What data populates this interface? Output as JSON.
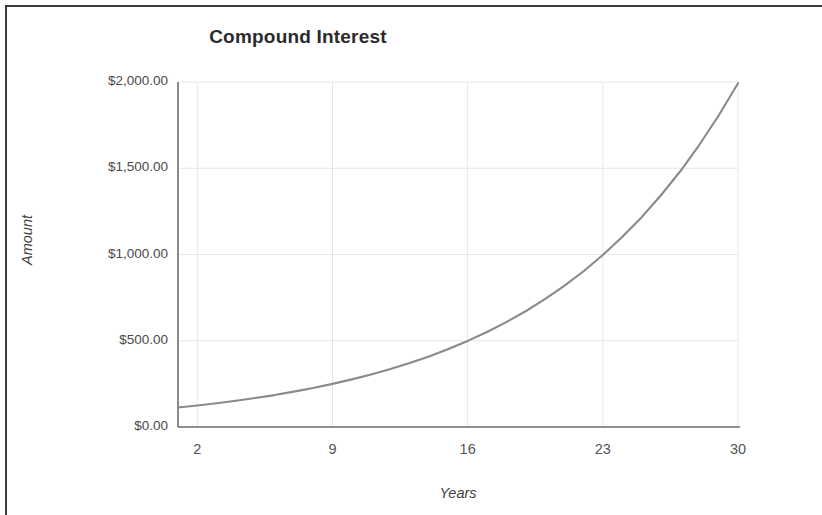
{
  "chart_data": {
    "type": "line",
    "title": "Compound Interest",
    "xlabel": "Years",
    "ylabel": "Amount",
    "xlim": [
      1,
      30
    ],
    "ylim": [
      0,
      2000
    ],
    "grid": true,
    "legend": false,
    "x_tick_labels": [
      "2",
      "9",
      "16",
      "23",
      "30"
    ],
    "x_tick_values": [
      2,
      9,
      16,
      23,
      30
    ],
    "y_tick_labels": [
      "$0.00",
      "$500.00",
      "$1,000.00",
      "$1,500.00",
      "$2,000.00"
    ],
    "y_tick_values": [
      0,
      500,
      1000,
      1500,
      2000
    ],
    "series": [
      {
        "name": "Amount",
        "color": "#8a8a8a",
        "x": [
          1,
          2,
          3,
          4,
          5,
          6,
          7,
          8,
          9,
          10,
          11,
          12,
          13,
          14,
          15,
          16,
          17,
          18,
          19,
          20,
          21,
          22,
          23,
          24,
          25,
          26,
          27,
          28,
          29,
          30
        ],
        "values": [
          113,
          125,
          138,
          152,
          168,
          185,
          205,
          226,
          250,
          276,
          304,
          336,
          371,
          409,
          452,
          499,
          551,
          608,
          671,
          741,
          818,
          903,
          997,
          1101,
          1215,
          1342,
          1481,
          1636,
          1806,
          1993
        ]
      }
    ]
  },
  "axes": {
    "y_title": "Amount",
    "x_title": "Years"
  },
  "plot_geometry": {
    "left": 178,
    "right": 738,
    "top": 82,
    "bottom": 427
  },
  "colors": {
    "line": "#8a8a8a",
    "grid": "#e6e6e6",
    "axis": "#6f6f6f",
    "frame": "#3a3a3a",
    "title_text": "#2b2b2b",
    "tick_text": "#4a4a4a",
    "background": "#ffffff"
  }
}
